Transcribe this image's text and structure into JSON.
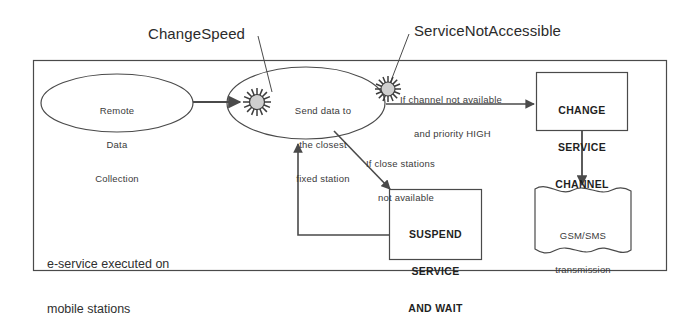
{
  "diagram": {
    "type": "flowchart",
    "title_annotations": [
      {
        "name": "change-speed",
        "text": "ChangeSpeed"
      },
      {
        "name": "service-not-accessible",
        "text": "ServiceNotAccessible"
      }
    ],
    "container": {
      "caption_lines": [
        "e-service executed on",
        "mobile stations"
      ]
    },
    "nodes": {
      "remote_data_collection": {
        "shape": "ellipse",
        "lines": [
          "Remote",
          "Data",
          "Collection"
        ]
      },
      "send_data": {
        "shape": "ellipse",
        "lines": [
          "Send data to",
          "the closest",
          "fixed station"
        ]
      },
      "change_service_channel": {
        "shape": "rectangle",
        "lines": [
          "CHANGE",
          "SERVICE",
          "CHANNEL"
        ]
      },
      "suspend_service": {
        "shape": "rectangle",
        "lines": [
          "SUSPEND",
          "SERVICE",
          "AND WAIT"
        ]
      },
      "gsm_sms": {
        "shape": "document",
        "lines": [
          "GSM/SMS",
          "transmission"
        ]
      }
    },
    "edge_labels": {
      "channel_unavailable": [
        "If channel not available",
        "and priority HIGH"
      ],
      "stations_unavailable": [
        "If close stations",
        "not available"
      ]
    },
    "icons": [
      {
        "name": "starburst-event-icon",
        "attached_to": "send_data"
      },
      {
        "name": "starburst-event-icon",
        "attached_to": "change_service_channel_transition"
      }
    ],
    "colors": {
      "stroke": "#4a4a4a",
      "text": "#2b2b2b",
      "icon_fill": "#cfcfcf",
      "background": "#ffffff"
    }
  }
}
